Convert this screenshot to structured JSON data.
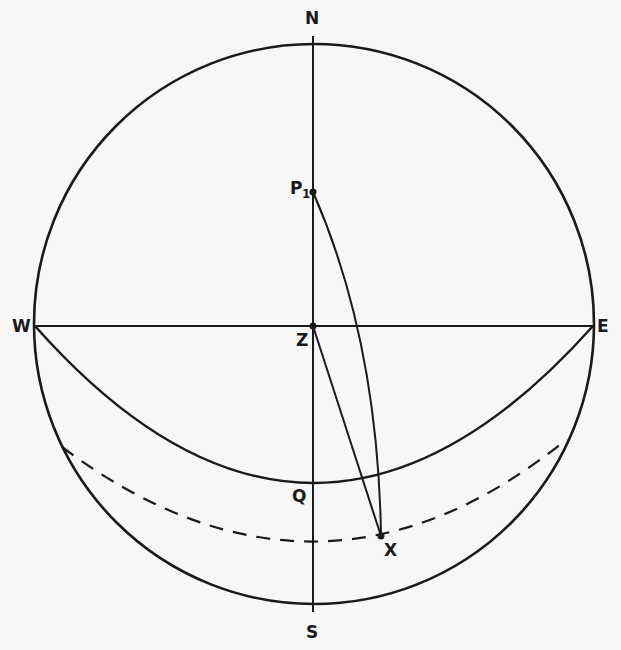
{
  "diagram": {
    "type": "celestial-sphere",
    "labels": {
      "north": "N",
      "south": "S",
      "east": "E",
      "west": "W",
      "zenith": "Z",
      "pole": "P",
      "pole_sub": "1",
      "q": "Q",
      "x": "X"
    },
    "colors": {
      "ink": "#1a1a1a",
      "paper": "#f7f7f7"
    }
  }
}
